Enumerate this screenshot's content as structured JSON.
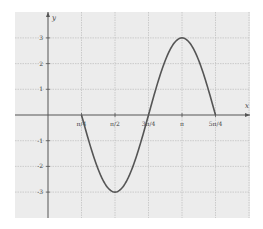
{
  "chart_data": {
    "type": "line",
    "title": "",
    "xlabel": "x",
    "ylabel": "y",
    "function": "y = 3cos(2x)",
    "domain": [
      "π/4",
      "5π/4"
    ],
    "x_ticks": [
      {
        "value": 0.7854,
        "label": "π/4"
      },
      {
        "value": 1.5708,
        "label": "π/2"
      },
      {
        "value": 2.3562,
        "label": "3π/4"
      },
      {
        "value": 3.1416,
        "label": "π"
      },
      {
        "value": 3.927,
        "label": "5π/4"
      }
    ],
    "y_ticks": [
      {
        "value": 3,
        "label": "3"
      },
      {
        "value": 2,
        "label": "2"
      },
      {
        "value": 1,
        "label": "1"
      },
      {
        "value": -1,
        "label": "-1"
      },
      {
        "value": -2,
        "label": "-2"
      },
      {
        "value": -3,
        "label": "-3"
      }
    ],
    "xlim": [
      -0.785,
      4.3
    ],
    "ylim": [
      -4,
      4
    ],
    "grid": true,
    "series": [
      {
        "name": "curve",
        "color": "#555555",
        "x": [
          0.7854,
          1.1781,
          1.5708,
          1.9635,
          2.3562,
          2.7489,
          3.1416,
          3.5343,
          3.927
        ],
        "y": [
          0,
          -2.12,
          -3,
          -2.12,
          0,
          2.12,
          3,
          2.12,
          0
        ]
      }
    ]
  },
  "style": {
    "background": "#ececec",
    "grid_color": "#bdbdbd",
    "axis_color": "#555555",
    "curve_color": "#555555"
  }
}
